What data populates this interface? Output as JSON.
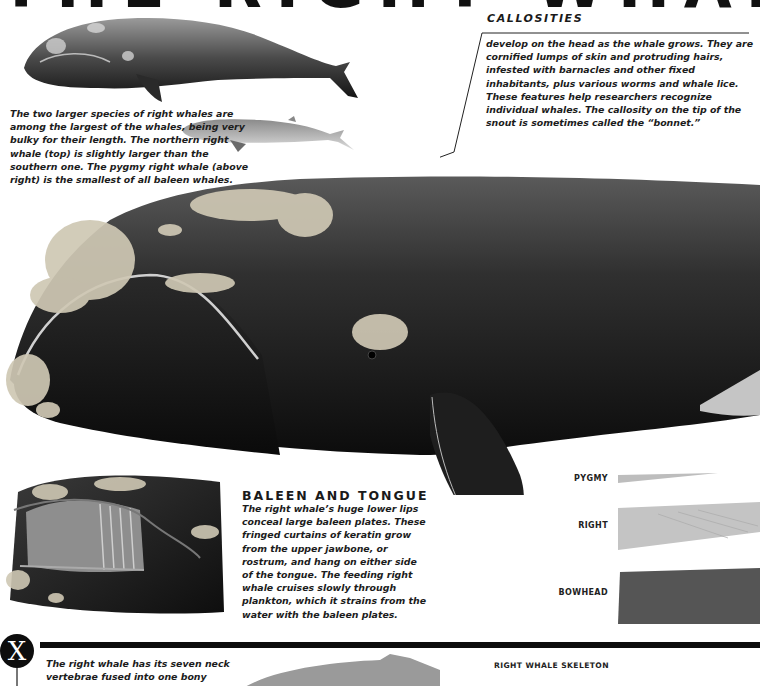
{
  "title": {
    "text": "THE RIGHT WHALE",
    "note": "cropped at top edge"
  },
  "intro": {
    "text": "The two larger species of right whales are among the largest of the whales, being very bulky for their length. The northern right whale (top) is slightly larger than the southern one. The pygmy right whale (above right) is the smallest of all baleen whales."
  },
  "illustrations": {
    "northern_whale": "northern-right-whale-illustration",
    "pygmy_whale": "pygmy-right-whale-illustration",
    "main_whale": "right-whale-head-closeup",
    "baleen_mouth": "baleen-mouth-cutaway"
  },
  "callosities": {
    "heading": "CALLOSITIES",
    "text": "develop on the head as the whale grows. They are cornified lumps of skin and protruding hairs, infested with barnacles and other fixed inhabitants, plus various worms and whale lice. These features help researchers recognize individual whales. The callosity on the tip of the snout is sometimes called the “bonnet.”"
  },
  "baleen": {
    "heading": "BALEEN AND TONGUE",
    "text": "The right whale’s huge lower lips conceal large baleen plates. These fringed curtains of keratin grow from the upper jawbone, or rostrum, and hang on either side of the tongue. The feeding right whale cruises slowly through plankton, which it strains from the water with the baleen plates."
  },
  "plates": [
    {
      "label": "PYGMY",
      "color": "#bdbdbd"
    },
    {
      "label": "RIGHT",
      "color": "#c4c4c4"
    },
    {
      "label": "BOWHEAD",
      "color": "#555555"
    }
  ],
  "fact": {
    "badge": "X",
    "text": "The right whale has its seven neck vertebrae fused into one bony"
  },
  "skeleton": {
    "heading": "RIGHT WHALE SKELETON"
  },
  "colors": {
    "ink": "#1a1a1a",
    "rule": "#0d0d0d",
    "whale_dark": "#161616",
    "callosity": "#cfc8b4"
  }
}
